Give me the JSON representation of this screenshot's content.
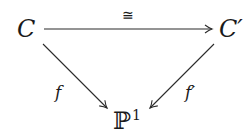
{
  "diagram": {
    "type": "commutative-triangle",
    "nodes": {
      "top_left": "C",
      "top_right": "C′",
      "bottom": "ℙ",
      "bottom_superscript": "1"
    },
    "arrows": [
      {
        "from": "C",
        "to": "C′",
        "label": "≅"
      },
      {
        "from": "C",
        "to": "ℙ1",
        "label": "f"
      },
      {
        "from": "C′",
        "to": "ℙ1",
        "label": "f′"
      }
    ],
    "labels": {
      "iso": "≅",
      "left": "f",
      "right": "f′"
    },
    "colors": {
      "stroke": "#2a2a2a",
      "text": "#1a1a1a",
      "background": "#ffffff"
    }
  }
}
